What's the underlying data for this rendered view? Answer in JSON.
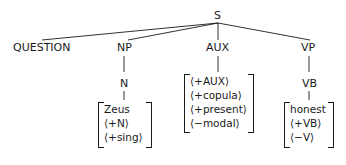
{
  "tree": {
    "root": "S",
    "children": [
      {
        "label": "QUESTION"
      },
      {
        "label": "NP",
        "child": "N",
        "features": [
          "Zeus",
          "⟨+N⟩",
          "⟨+sing⟩"
        ]
      },
      {
        "label": "AUX",
        "features": [
          "⟨+AUX⟩",
          "⟨+copula⟩",
          "⟨+present⟩",
          "⟨−modal⟩"
        ]
      },
      {
        "label": "VP",
        "child": "VB",
        "features": [
          "honest",
          "⟨+VB⟩",
          "⟨−V⟩"
        ]
      }
    ]
  }
}
